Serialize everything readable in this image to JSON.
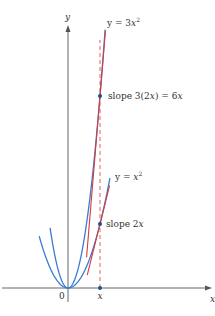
{
  "figure": {
    "axes": {
      "x_label": "x",
      "y_label": "y",
      "origin_label": "0",
      "x_point_label": "x",
      "x_point_value": 1
    },
    "curves": [
      {
        "name": "y = 3x^2",
        "coef": 3,
        "label_prefix": "y = 3",
        "label_var": "x",
        "label_exp": "2",
        "domain": [
          -0.56,
          1.16
        ]
      },
      {
        "name": "y = x^2",
        "coef": 1,
        "label_prefix": "y = ",
        "label_var": "x",
        "label_exp": "2",
        "domain": [
          -0.9,
          1.31
        ]
      }
    ],
    "tangents": [
      {
        "curve": "y = 3x^2",
        "at_x": 1,
        "slope": 6,
        "label": "slope 3(2x) = 6x",
        "label_parts": [
          "slope 3(2",
          "x",
          ") = 6",
          "x"
        ],
        "range": [
          0.58,
          1.17
        ]
      },
      {
        "curve": "y = x^2",
        "at_x": 1,
        "slope": 2,
        "label": "slope 2x",
        "label_parts": [
          "slope 2",
          "x"
        ],
        "range": [
          0.6,
          1.3
        ]
      }
    ],
    "colors": {
      "curve": "#3a7bd5",
      "tangent": "#d93a3a",
      "dashed": "#e05050",
      "axis": "#555555",
      "point": "#1f4e8c"
    }
  }
}
